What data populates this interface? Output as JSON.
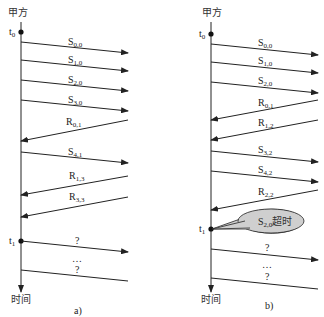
{
  "diagrams": [
    {
      "caption": "a)",
      "sender_label": "甲方",
      "time_label": "时间",
      "t0_label": "t",
      "t0_sub": "0",
      "t1_label": "t",
      "t1_sub": "1",
      "messages": [
        {
          "dir": "send",
          "name": "S",
          "sub": "0,0"
        },
        {
          "dir": "send",
          "name": "S",
          "sub": "1,0"
        },
        {
          "dir": "send",
          "name": "S",
          "sub": "2,0"
        },
        {
          "dir": "send",
          "name": "S",
          "sub": "3,0"
        },
        {
          "dir": "recv",
          "name": "R",
          "sub": "0,1"
        },
        {
          "dir": "send",
          "name": "S",
          "sub": "4,1"
        },
        {
          "dir": "recv",
          "name": "R",
          "sub": "1,3"
        },
        {
          "dir": "recv",
          "name": "R",
          "sub": "3,3"
        },
        {
          "dir": "send",
          "name": "?",
          "sub": ""
        },
        {
          "dir": "ellipsis",
          "name": "…",
          "sub": ""
        },
        {
          "dir": "send-open",
          "name": "?",
          "sub": ""
        }
      ]
    },
    {
      "caption": "b)",
      "sender_label": "甲方",
      "time_label": "时间",
      "t0_label": "t",
      "t0_sub": "0",
      "t1_label": "t",
      "t1_sub": "1",
      "callout": {
        "name": "S",
        "sub": "2,0",
        "text": "超时"
      },
      "messages": [
        {
          "dir": "send",
          "name": "S",
          "sub": "0,0"
        },
        {
          "dir": "send",
          "name": "S",
          "sub": "1,0"
        },
        {
          "dir": "send",
          "name": "S",
          "sub": "2,0"
        },
        {
          "dir": "recv",
          "name": "R",
          "sub": "0,1"
        },
        {
          "dir": "recv",
          "name": "R",
          "sub": "1,2"
        },
        {
          "dir": "send",
          "name": "S",
          "sub": "3,2"
        },
        {
          "dir": "send",
          "name": "S",
          "sub": "4,2"
        },
        {
          "dir": "recv",
          "name": "R",
          "sub": "2,2"
        },
        {
          "dir": "send",
          "name": "?",
          "sub": ""
        },
        {
          "dir": "ellipsis",
          "name": "…",
          "sub": ""
        },
        {
          "dir": "send-open",
          "name": "?",
          "sub": ""
        }
      ]
    }
  ],
  "colors": {
    "line": "#222222",
    "callout_fill": "#cfcfcf",
    "text": "#222222"
  }
}
